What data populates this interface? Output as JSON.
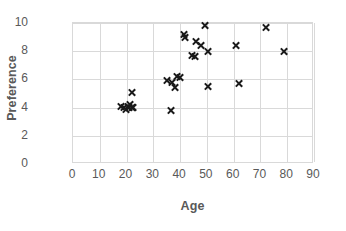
{
  "chart_data": {
    "type": "scatter",
    "title": "",
    "xlabel": "Age",
    "ylabel": "Preference",
    "xlim": [
      0,
      90
    ],
    "ylim": [
      0,
      10
    ],
    "xticks": [
      0,
      10,
      20,
      30,
      40,
      50,
      60,
      70,
      80,
      90
    ],
    "yticks": [
      0,
      2,
      4,
      6,
      8,
      10
    ],
    "grid": true,
    "legend": null,
    "marker": "x",
    "marker_color": "#1a1a1a",
    "grid_color": "#d9d9d9",
    "label_color": "#595959",
    "series": [
      {
        "name": "Age vs Preference",
        "points": [
          {
            "x": 18,
            "y": 4.1
          },
          {
            "x": 19,
            "y": 4.0
          },
          {
            "x": 20,
            "y": 3.9
          },
          {
            "x": 20.5,
            "y": 4.1
          },
          {
            "x": 21,
            "y": 4.0
          },
          {
            "x": 21.5,
            "y": 4.2
          },
          {
            "x": 22,
            "y": 4.0
          },
          {
            "x": 22,
            "y": 5.1
          },
          {
            "x": 22.5,
            "y": 4.0
          },
          {
            "x": 35,
            "y": 5.9
          },
          {
            "x": 36.5,
            "y": 3.8
          },
          {
            "x": 37,
            "y": 5.8
          },
          {
            "x": 38,
            "y": 5.4
          },
          {
            "x": 39,
            "y": 6.2
          },
          {
            "x": 40,
            "y": 6.1
          },
          {
            "x": 41.5,
            "y": 9.2
          },
          {
            "x": 42,
            "y": 9.0
          },
          {
            "x": 44.5,
            "y": 7.7
          },
          {
            "x": 45.5,
            "y": 7.6
          },
          {
            "x": 46,
            "y": 8.7
          },
          {
            "x": 48,
            "y": 8.4
          },
          {
            "x": 49.5,
            "y": 9.8
          },
          {
            "x": 50.5,
            "y": 8.0
          },
          {
            "x": 50.5,
            "y": 5.5
          },
          {
            "x": 61,
            "y": 8.4
          },
          {
            "x": 62,
            "y": 5.7
          },
          {
            "x": 72,
            "y": 9.7
          },
          {
            "x": 79,
            "y": 8.0
          }
        ]
      }
    ]
  }
}
